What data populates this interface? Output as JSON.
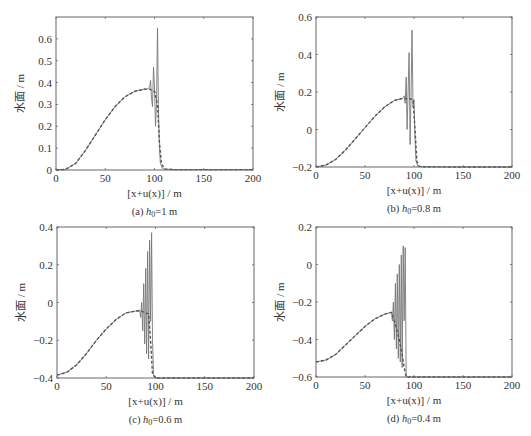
{
  "figure": {
    "panels": [
      {
        "id": "a",
        "caption_prefix": "(a) ",
        "caption_var": "h",
        "caption_sub": "0",
        "caption_rest": "=1 m"
      },
      {
        "id": "b",
        "caption_prefix": "(b) ",
        "caption_var": "h",
        "caption_sub": "0",
        "caption_rest": "=0.8 m"
      },
      {
        "id": "c",
        "caption_prefix": "(c) ",
        "caption_var": "h",
        "caption_sub": "0",
        "caption_rest": "=0.6 m"
      },
      {
        "id": "d",
        "caption_prefix": "(d) ",
        "caption_var": "h",
        "caption_sub": "0",
        "caption_rest": "=0.4 m"
      }
    ],
    "xlabel": "[x+u(x)] / m",
    "ylabel": "水面 / m"
  },
  "chart_data": [
    {
      "type": "line",
      "title": "(a) h0=1 m",
      "xlabel": "[x+u(x)] / m",
      "ylabel": "水面 / m",
      "xlim": [
        0,
        200
      ],
      "ylim": [
        0,
        0.7
      ],
      "xticks": [
        0,
        50,
        100,
        150,
        200
      ],
      "yticks": [
        0,
        0.1,
        0.2,
        0.3,
        0.4,
        0.5,
        0.6
      ],
      "ytick_labels": [
        "0",
        "0.1",
        "0.2",
        "0.3",
        "0.4",
        "0.5",
        "0.6"
      ],
      "grid": false,
      "frame": {
        "left": 56,
        "top": 17,
        "right": 253,
        "bottom": 170
      },
      "series": [
        {
          "name": "solid (numerical, with dispersion)",
          "style": "solid",
          "x": [
            0,
            10,
            20,
            30,
            40,
            50,
            60,
            70,
            80,
            90,
            93,
            95,
            96,
            97,
            98,
            99,
            100,
            101,
            102,
            103,
            104,
            105,
            106,
            108,
            110,
            120,
            150,
            200
          ],
          "y": [
            0,
            0.003,
            0.03,
            0.09,
            0.16,
            0.23,
            0.29,
            0.335,
            0.36,
            0.37,
            0.37,
            0.38,
            0.41,
            0.33,
            0.29,
            0.47,
            0.38,
            0.2,
            0.3,
            0.65,
            0.3,
            0.1,
            0.03,
            0.008,
            0.003,
            0.002,
            0.002,
            0.002
          ]
        },
        {
          "name": "dashed (analytical / smooth)",
          "style": "dashed",
          "x": [
            0,
            10,
            20,
            30,
            40,
            50,
            60,
            70,
            80,
            90,
            95,
            100,
            103,
            105,
            107,
            110,
            120,
            150,
            200
          ],
          "y": [
            0,
            0.003,
            0.03,
            0.09,
            0.16,
            0.23,
            0.29,
            0.335,
            0.36,
            0.37,
            0.37,
            0.36,
            0.3,
            0.13,
            0.03,
            0.005,
            0.002,
            0.002,
            0.002
          ]
        }
      ]
    },
    {
      "type": "line",
      "title": "(b) h0=0.8 m",
      "xlabel": "[x+u(x)] / m",
      "ylabel": "水面 / m",
      "xlim": [
        0,
        200
      ],
      "ylim": [
        -0.2,
        0.6
      ],
      "xticks": [
        0,
        50,
        100,
        150,
        200
      ],
      "yticks": [
        -0.2,
        0,
        0.2,
        0.4,
        0.6
      ],
      "ytick_labels": [
        "−0.2",
        "0",
        "0.2",
        "0.4",
        "0.6"
      ],
      "grid": false,
      "frame": {
        "left": 316,
        "top": 17,
        "right": 512,
        "bottom": 167
      },
      "series": [
        {
          "name": "solid (numerical, with dispersion)",
          "style": "solid",
          "x": [
            0,
            10,
            20,
            30,
            40,
            50,
            60,
            70,
            80,
            88,
            90,
            91,
            92,
            93,
            94,
            95,
            96,
            97,
            98,
            99,
            100,
            101,
            102,
            104,
            106,
            110,
            150,
            200
          ],
          "y": [
            -0.2,
            -0.19,
            -0.16,
            -0.11,
            -0.05,
            0.01,
            0.07,
            0.12,
            0.155,
            0.165,
            0.18,
            0.14,
            0.28,
            0.0,
            0.2,
            0.41,
            -0.08,
            0.2,
            0.53,
            0.12,
            0.16,
            -0.05,
            -0.17,
            -0.195,
            -0.198,
            -0.199,
            -0.2,
            -0.2
          ]
        },
        {
          "name": "dashed (analytical / smooth)",
          "style": "dashed",
          "x": [
            0,
            10,
            20,
            30,
            40,
            50,
            60,
            70,
            80,
            88,
            95,
            99,
            101,
            103,
            105,
            110,
            150,
            200
          ],
          "y": [
            -0.2,
            -0.19,
            -0.16,
            -0.11,
            -0.05,
            0.01,
            0.07,
            0.12,
            0.155,
            0.165,
            0.165,
            0.16,
            0.0,
            -0.17,
            -0.195,
            -0.199,
            -0.2,
            -0.2
          ]
        }
      ]
    },
    {
      "type": "line",
      "title": "(c) h0=0.6 m",
      "xlabel": "[x+u(x)] / m",
      "ylabel": "水面 / m",
      "xlim": [
        0,
        200
      ],
      "ylim": [
        -0.4,
        0.4
      ],
      "xticks": [
        0,
        50,
        100,
        150,
        200
      ],
      "yticks": [
        -0.4,
        -0.2,
        0,
        0.2,
        0.4
      ],
      "ytick_labels": [
        "−0.4",
        "−0.2",
        "0",
        "0.2",
        "0.4"
      ],
      "grid": false,
      "frame": {
        "left": 57,
        "top": 227,
        "right": 254,
        "bottom": 378
      },
      "series": [
        {
          "name": "solid (numerical, with dispersion)",
          "style": "solid",
          "x": [
            0,
            10,
            20,
            30,
            40,
            50,
            60,
            70,
            80,
            84,
            85,
            86,
            87,
            88,
            89,
            90,
            91,
            92,
            93,
            94,
            95,
            96,
            97,
            98,
            100,
            110,
            150,
            200
          ],
          "y": [
            -0.385,
            -0.37,
            -0.33,
            -0.27,
            -0.2,
            -0.14,
            -0.09,
            -0.055,
            -0.045,
            -0.04,
            -0.08,
            0.0,
            -0.15,
            0.1,
            -0.22,
            0.18,
            -0.27,
            0.27,
            -0.3,
            0.33,
            -0.1,
            0.37,
            -0.2,
            -0.38,
            -0.4,
            -0.4,
            -0.4,
            -0.4
          ]
        },
        {
          "name": "dashed (analytical / smooth)",
          "style": "dashed",
          "x": [
            0,
            10,
            20,
            30,
            40,
            50,
            60,
            70,
            80,
            85,
            90,
            93,
            95,
            97,
            100,
            110,
            150,
            200
          ],
          "y": [
            -0.385,
            -0.37,
            -0.33,
            -0.27,
            -0.2,
            -0.14,
            -0.09,
            -0.055,
            -0.045,
            -0.045,
            -0.055,
            -0.06,
            -0.2,
            -0.38,
            -0.4,
            -0.4,
            -0.4,
            -0.4
          ]
        }
      ]
    },
    {
      "type": "line",
      "title": "(d) h0=0.4 m",
      "xlabel": "[x+u(x)] / m",
      "ylabel": "水面 / m",
      "xlim": [
        0,
        200
      ],
      "ylim": [
        -0.6,
        0.2
      ],
      "xticks": [
        0,
        50,
        100,
        150,
        200
      ],
      "yticks": [
        -0.6,
        -0.4,
        -0.2,
        0,
        0.2
      ],
      "ytick_labels": [
        "−0.6",
        "−0.4",
        "−0.2",
        "0",
        "0.2"
      ],
      "grid": false,
      "frame": {
        "left": 316,
        "top": 227,
        "right": 512,
        "bottom": 377
      },
      "series": [
        {
          "name": "solid (numerical, with dispersion)",
          "style": "solid",
          "x": [
            0,
            10,
            20,
            30,
            40,
            50,
            60,
            70,
            77,
            78,
            79,
            80,
            81,
            82,
            83,
            84,
            85,
            86,
            87,
            88,
            89,
            90,
            91,
            92,
            95,
            110,
            150,
            200
          ],
          "y": [
            -0.52,
            -0.51,
            -0.48,
            -0.43,
            -0.38,
            -0.33,
            -0.29,
            -0.265,
            -0.255,
            -0.3,
            -0.2,
            -0.4,
            -0.1,
            -0.45,
            -0.05,
            -0.5,
            0.0,
            -0.52,
            0.05,
            -0.55,
            0.1,
            -0.3,
            0.09,
            -0.6,
            -0.6,
            -0.6,
            -0.6,
            -0.6
          ]
        },
        {
          "name": "dashed (analytical / smooth)",
          "style": "dashed",
          "x": [
            0,
            10,
            20,
            30,
            40,
            50,
            60,
            70,
            77,
            80,
            85,
            88,
            90,
            92,
            95,
            110,
            150,
            200
          ],
          "y": [
            -0.52,
            -0.51,
            -0.48,
            -0.43,
            -0.38,
            -0.33,
            -0.29,
            -0.265,
            -0.255,
            -0.3,
            -0.4,
            -0.48,
            -0.55,
            -0.6,
            -0.6,
            -0.6,
            -0.6,
            -0.6
          ]
        }
      ]
    }
  ]
}
